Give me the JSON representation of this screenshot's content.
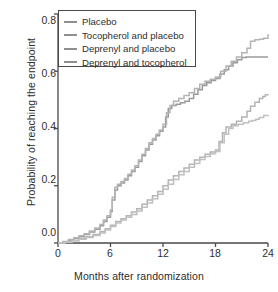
{
  "chart_data": {
    "type": "line",
    "title": "",
    "xlabel": "Months after randomization",
    "ylabel": "Probability of reaching the endpoint",
    "xlim": [
      0,
      24
    ],
    "ylim": [
      0,
      0.8
    ],
    "xticks": [
      0,
      6,
      12,
      18,
      24
    ],
    "xticklabels": [
      "0",
      "6",
      "12",
      "18",
      "24"
    ],
    "yticks": [
      0.0,
      0.2,
      0.4,
      0.6,
      0.8
    ],
    "yticklabels": [
      "0.0",
      "0.2",
      "0.4",
      "0.6",
      "0.8"
    ],
    "grid": false,
    "legend_position": "top-left",
    "step_style": "post",
    "series": [
      {
        "name": "Placebo",
        "color": "#9a9a9a",
        "x": [
          0,
          0.6,
          1.2,
          1.8,
          2.4,
          3.0,
          3.6,
          4.2,
          4.8,
          5.2,
          5.6,
          6.0,
          6.2,
          6.5,
          6.8,
          7.2,
          7.6,
          8.0,
          8.4,
          8.8,
          9.2,
          9.6,
          10.0,
          10.4,
          10.8,
          11.2,
          11.6,
          12.0,
          12.3,
          12.6,
          13.0,
          13.5,
          14.0,
          14.5,
          15.0,
          15.5,
          16.0,
          16.5,
          17.0,
          17.5,
          18.0,
          18.5,
          19.0,
          19.5,
          20.0,
          20.5,
          21.0,
          21.5,
          22.0,
          22.5,
          23.0,
          23.5,
          24.0
        ],
        "y": [
          0.0,
          0.004,
          0.01,
          0.016,
          0.022,
          0.03,
          0.038,
          0.048,
          0.06,
          0.075,
          0.09,
          0.11,
          0.15,
          0.185,
          0.2,
          0.21,
          0.22,
          0.235,
          0.25,
          0.265,
          0.285,
          0.305,
          0.325,
          0.345,
          0.36,
          0.375,
          0.39,
          0.405,
          0.44,
          0.47,
          0.48,
          0.485,
          0.49,
          0.495,
          0.505,
          0.52,
          0.535,
          0.55,
          0.56,
          0.568,
          0.575,
          0.59,
          0.605,
          0.618,
          0.63,
          0.64,
          0.648,
          0.65,
          0.65,
          0.65,
          0.65,
          0.65,
          0.65
        ]
      },
      {
        "name": "Tocopherol and placebo",
        "color": "#b4b4b4",
        "x": [
          0,
          0.6,
          1.2,
          1.8,
          2.4,
          3.0,
          3.6,
          4.2,
          4.8,
          5.2,
          5.6,
          6.0,
          6.2,
          6.5,
          6.8,
          7.2,
          7.6,
          8.0,
          8.4,
          8.8,
          9.2,
          9.6,
          10.0,
          10.4,
          10.8,
          11.2,
          11.6,
          12.0,
          12.4,
          12.8,
          13.2,
          13.8,
          14.4,
          15.0,
          15.6,
          16.2,
          16.8,
          17.4,
          18.0,
          18.6,
          19.2,
          19.8,
          20.4,
          21.0,
          21.6,
          22.0,
          22.5,
          23.0,
          23.5,
          24.0
        ],
        "y": [
          0.0,
          0.005,
          0.012,
          0.018,
          0.025,
          0.032,
          0.042,
          0.052,
          0.065,
          0.08,
          0.095,
          0.115,
          0.16,
          0.195,
          0.205,
          0.215,
          0.225,
          0.24,
          0.255,
          0.27,
          0.29,
          0.31,
          0.33,
          0.35,
          0.365,
          0.38,
          0.395,
          0.415,
          0.455,
          0.48,
          0.495,
          0.505,
          0.515,
          0.525,
          0.54,
          0.555,
          0.565,
          0.572,
          0.58,
          0.6,
          0.618,
          0.635,
          0.65,
          0.665,
          0.68,
          0.705,
          0.71,
          0.712,
          0.715,
          0.73
        ]
      },
      {
        "name": "Deprenyl and placebo",
        "color": "#b4b4b4",
        "x": [
          0,
          0.8,
          1.6,
          2.4,
          3.2,
          4.0,
          4.8,
          5.4,
          6.0,
          6.6,
          7.2,
          7.8,
          8.4,
          9.0,
          9.6,
          10.2,
          10.8,
          11.4,
          12.0,
          12.6,
          13.2,
          13.8,
          14.4,
          15.0,
          15.6,
          16.2,
          16.8,
          17.4,
          18.0,
          18.4,
          18.8,
          19.2,
          19.8,
          20.4,
          21.0,
          21.6,
          22.0,
          22.5,
          23.0,
          23.4,
          23.7,
          24.0
        ],
        "y": [
          0.0,
          0.004,
          0.009,
          0.015,
          0.022,
          0.03,
          0.04,
          0.05,
          0.062,
          0.075,
          0.085,
          0.095,
          0.108,
          0.12,
          0.135,
          0.15,
          0.165,
          0.18,
          0.2,
          0.22,
          0.235,
          0.25,
          0.262,
          0.275,
          0.29,
          0.3,
          0.31,
          0.318,
          0.325,
          0.355,
          0.385,
          0.405,
          0.415,
          0.425,
          0.44,
          0.46,
          0.478,
          0.492,
          0.505,
          0.512,
          0.518,
          0.52
        ]
      },
      {
        "name": "Deprenyl and tocopherol",
        "color": "#c0c0c0",
        "x": [
          0,
          0.8,
          1.6,
          2.4,
          3.2,
          4.0,
          4.8,
          5.4,
          6.0,
          6.6,
          7.2,
          7.8,
          8.4,
          9.0,
          9.6,
          10.2,
          10.8,
          11.4,
          12.0,
          12.6,
          13.2,
          13.8,
          14.4,
          15.0,
          15.6,
          16.2,
          16.8,
          17.4,
          18.0,
          18.5,
          19.0,
          19.5,
          20.0,
          20.6,
          21.2,
          21.8,
          22.2,
          22.6,
          23.0,
          23.5,
          24.0
        ],
        "y": [
          0.0,
          0.003,
          0.008,
          0.013,
          0.019,
          0.026,
          0.035,
          0.045,
          0.058,
          0.07,
          0.08,
          0.09,
          0.1,
          0.112,
          0.125,
          0.14,
          0.155,
          0.17,
          0.188,
          0.205,
          0.222,
          0.238,
          0.25,
          0.265,
          0.278,
          0.292,
          0.302,
          0.312,
          0.32,
          0.35,
          0.38,
          0.4,
          0.41,
          0.415,
          0.42,
          0.425,
          0.428,
          0.432,
          0.438,
          0.445,
          0.448
        ]
      }
    ]
  },
  "legend": {
    "items": [
      {
        "label": "Placebo"
      },
      {
        "label": "Tocopherol and placebo"
      },
      {
        "label": "Deprenyl and placebo"
      },
      {
        "label": "Deprenyl and tocopherol"
      }
    ]
  },
  "axes": {
    "x_title": "Months after randomization",
    "y_title": "Probability of reaching the endpoint",
    "x_tick_labels": [
      "0",
      "6",
      "12",
      "18",
      "24"
    ],
    "y_tick_labels": [
      "0.0",
      "0.2",
      "0.4",
      "0.6",
      "0.8"
    ]
  },
  "colors": {
    "axis": "#4a4a4a",
    "text": "#2e2e2e",
    "series_dark": "#9a9a9a",
    "series_mid": "#b4b4b4",
    "series_light": "#c0c0c0"
  }
}
